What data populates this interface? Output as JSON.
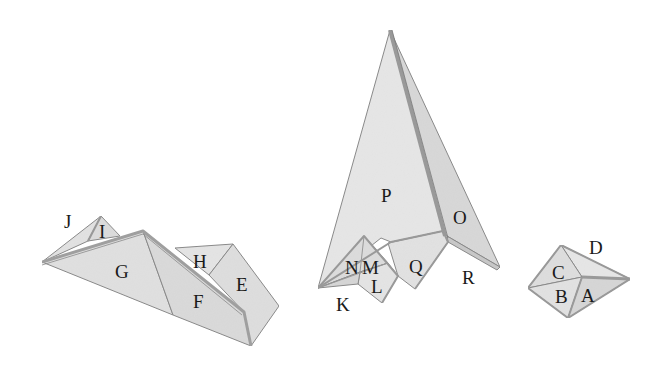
{
  "diagram": {
    "colors": {
      "face_light": "#e6e6e6",
      "face_mid": "#dadada",
      "face_dark": "#cdcdcd",
      "edge": "#8a8a8a",
      "rim": "#a8a8a8",
      "label": "#1a1a1a",
      "background": "#ffffff"
    },
    "shapes": [
      {
        "name": "left-ridge-shape",
        "labels": {
          "J": "J",
          "I": "I",
          "G": "G",
          "H": "H",
          "F": "F",
          "E": "E"
        }
      },
      {
        "name": "center-tall-shape",
        "labels": {
          "P": "P",
          "O": "O",
          "Q": "Q",
          "R": "R",
          "N": "N",
          "M": "M",
          "L": "L",
          "K": "K"
        }
      },
      {
        "name": "right-small-shape",
        "labels": {
          "D": "D",
          "C": "C",
          "B": "B",
          "A": "A"
        }
      }
    ]
  }
}
